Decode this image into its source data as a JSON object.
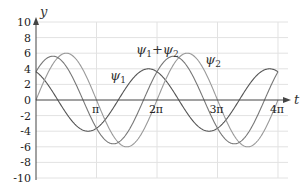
{
  "chart_data": {
    "type": "line",
    "title": "",
    "xlabel": "t",
    "ylabel": "y",
    "xlim": [
      0,
      12.566
    ],
    "ylim": [
      -10,
      10
    ],
    "grid": true,
    "x_ticks": [
      {
        "value": 3.1416,
        "label": "π"
      },
      {
        "value": 6.2832,
        "label": "2π"
      },
      {
        "value": 9.4248,
        "label": "3π"
      },
      {
        "value": 12.566,
        "label": "4π"
      }
    ],
    "y_ticks": [
      10,
      8,
      6,
      4,
      2,
      0,
      -2,
      -4,
      -6,
      -8,
      -10
    ],
    "series": [
      {
        "name": "ψ1",
        "formula": "4*cos(t + 0.14π)",
        "amplitude": 4,
        "phase": 0.44,
        "color": "#555555",
        "label": {
          "text": "ψ",
          "sub": "1",
          "x": 110,
          "y": 80
        }
      },
      {
        "name": "ψ2",
        "formula": "6*sin(t)",
        "amplitude": 6,
        "phase": -1.5708,
        "color": "#999999",
        "label": {
          "text": "ψ",
          "sub": "2",
          "x": 205,
          "y": 64
        }
      },
      {
        "name": "ψ1+ψ2",
        "formula": "ψ1 + ψ2",
        "amplitude": 5.6,
        "phase": -0.87,
        "color": "#777777",
        "label": {
          "text": "ψ",
          "sub": "1",
          "text2": "+ψ",
          "sub2": "2",
          "x": 136,
          "y": 54
        }
      }
    ]
  },
  "axes": {
    "x_label": "t",
    "y_label": "y"
  }
}
